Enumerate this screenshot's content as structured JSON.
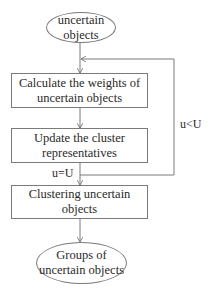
{
  "diagram": {
    "type": "flowchart",
    "nodes": {
      "start": {
        "shape": "ellipse",
        "line1": "uncertain",
        "line2": "objects"
      },
      "step1": {
        "shape": "rectangle",
        "line1": "Calculate the weights of",
        "line2": "uncertain objects"
      },
      "step2": {
        "shape": "rectangle",
        "line1": "Update the cluster",
        "line2": "representatives"
      },
      "step3": {
        "shape": "rectangle",
        "line1": "Clustering uncertain",
        "line2": "objects"
      },
      "end": {
        "shape": "ellipse",
        "line1": "Groups of",
        "line2": "uncertain objects"
      }
    },
    "edge_labels": {
      "exit_condition": "u=U",
      "loop_condition": "u<U"
    },
    "edges": [
      {
        "from": "start",
        "to": "step1"
      },
      {
        "from": "step1",
        "to": "step2"
      },
      {
        "from": "step2",
        "to": "step3",
        "label": "u=U"
      },
      {
        "from": "step2",
        "to": "step1",
        "label": "u<U",
        "kind": "feedback-loop"
      },
      {
        "from": "step3",
        "to": "end"
      }
    ],
    "colors": {
      "stroke": "#7a7a7a",
      "text": "#2a2a2a",
      "background": "#ffffff"
    }
  }
}
